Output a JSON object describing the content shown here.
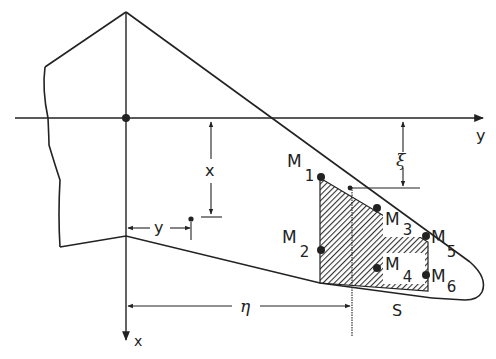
{
  "figure": {
    "type": "wing planform diagram",
    "colors": {
      "ink": "#222222",
      "background": "#ffffff",
      "hatch": "#333333"
    }
  },
  "axes": {
    "y_axis_label": "y",
    "x_axis_label": "x"
  },
  "dimensions": {
    "x_label": "x",
    "y_label": "y",
    "xi_label": "ξ",
    "eta_label": "η"
  },
  "masses": [
    {
      "name": "M",
      "sub": "1"
    },
    {
      "name": "M",
      "sub": "2"
    },
    {
      "name": "M",
      "sub": "3"
    },
    {
      "name": "M",
      "sub": "4"
    },
    {
      "name": "M",
      "sub": "5"
    },
    {
      "name": "M",
      "sub": "6"
    }
  ],
  "region_label": "S"
}
